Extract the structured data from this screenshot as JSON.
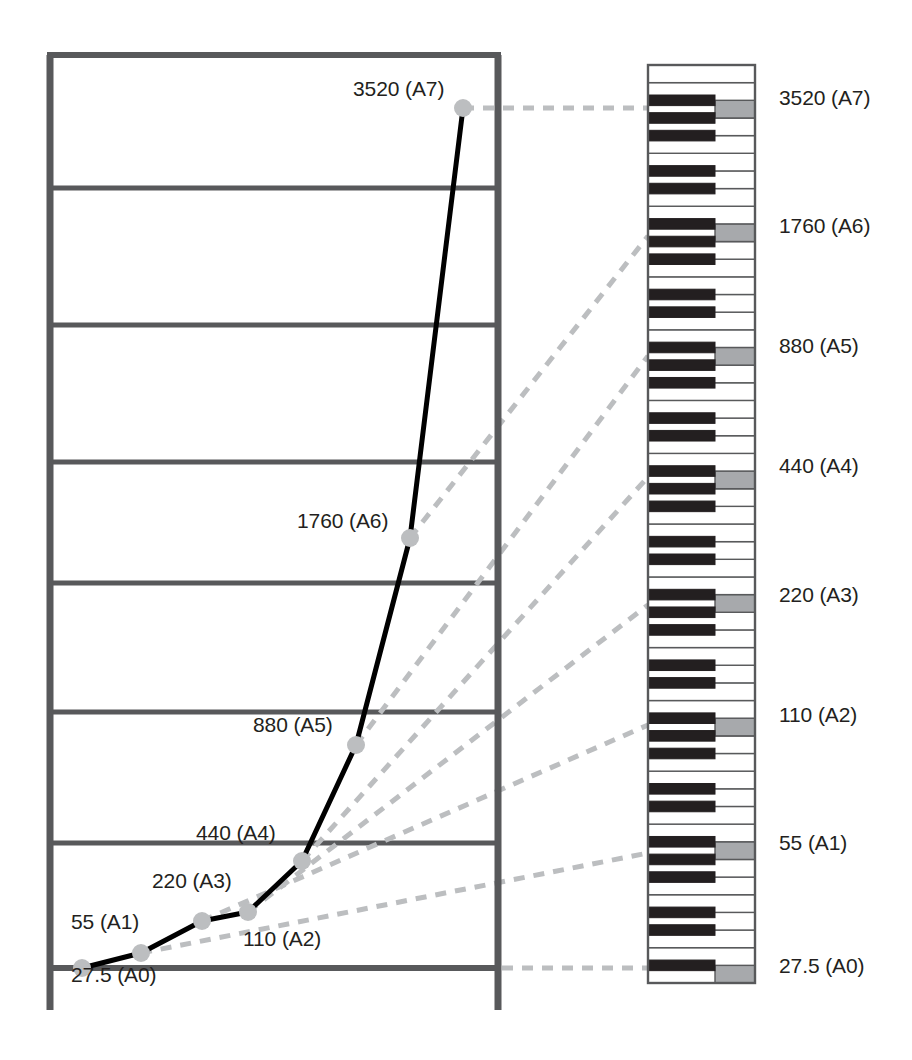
{
  "figure": {
    "title": ""
  },
  "colors": {
    "frame": "#58595b",
    "gridline": "#58595b",
    "curve": "#000000",
    "marker": "#bcbec0",
    "dashed_connector": "#bcbec0",
    "key_white": "#ffffff",
    "key_black": "#231f20",
    "key_highlight": "#a7a9ac",
    "key_outline": "#58595b",
    "text": "#231f20"
  },
  "chart_data": {
    "type": "line",
    "title": "",
    "xlabel": "",
    "ylabel": "",
    "grid": true,
    "gridlines_y": [
      27.5,
      440,
      880,
      1320,
      1760,
      2640,
      3520,
      4400
    ],
    "legend": "none",
    "categories": [
      "A0",
      "A1",
      "A2",
      "A3",
      "A4",
      "A5",
      "A6",
      "A7"
    ],
    "series": [
      {
        "name": "Frequency (Hz)",
        "values": [
          27.5,
          55,
          110,
          220,
          440,
          880,
          1760,
          3520
        ]
      }
    ],
    "point_labels": [
      "27.5 (A0)",
      "55 (A1)",
      "110 (A2)",
      "220 (A3)",
      "440 (A4)",
      "880 (A5)",
      "1760 (A6)",
      "3520 (A7)"
    ],
    "points": [
      {
        "label": "27.5 (A0)",
        "freq": 27.5,
        "note": "A0",
        "x": 82,
        "y": 968,
        "lx": 71,
        "ly": 978,
        "anchor": "left"
      },
      {
        "label": "55 (A1)",
        "freq": 55,
        "note": "A1",
        "x": 141,
        "y": 953,
        "lx": 71,
        "ly": 925,
        "anchor": "left"
      },
      {
        "label": "110 (A2)",
        "freq": 110,
        "note": "A2",
        "x": 202,
        "y": 921,
        "lx": 243,
        "ly": 942,
        "anchor": "left"
      },
      {
        "label": "220 (A3)",
        "freq": 220,
        "note": "A3",
        "x": 248,
        "y": 912,
        "lx": 152,
        "ly": 884,
        "anchor": "left"
      },
      {
        "label": "440 (A4)",
        "freq": 440,
        "note": "A4",
        "x": 302,
        "y": 861,
        "lx": 196,
        "ly": 836,
        "anchor": "left"
      },
      {
        "label": "880 (A5)",
        "freq": 880,
        "note": "A5",
        "x": 356,
        "y": 745,
        "lx": 253,
        "ly": 728,
        "anchor": "left"
      },
      {
        "label": "1760 (A6)",
        "freq": 1760,
        "note": "A6",
        "x": 410,
        "y": 538,
        "lx": 297,
        "ly": 524,
        "anchor": "left"
      },
      {
        "label": "3520 (A7)",
        "freq": 3520,
        "note": "A7",
        "x": 463,
        "y": 108,
        "lx": 353,
        "ly": 92,
        "anchor": "left"
      }
    ]
  },
  "keyboard": {
    "name": "piano-keyboard",
    "orientation": "vertical",
    "octave_count": 7,
    "highlighted_note": "A",
    "labels": [
      {
        "text": "3520 (A7)",
        "y": 100,
        "note": "A7"
      },
      {
        "text": "1760 (A6)",
        "y": 228,
        "note": "A6"
      },
      {
        "text": "880 (A5)",
        "y": 348,
        "note": "A5"
      },
      {
        "text": "440 (A4)",
        "y": 468,
        "note": "A4"
      },
      {
        "text": "220 (A3)",
        "y": 597,
        "note": "A3"
      },
      {
        "text": "110 (A2)",
        "y": 717,
        "note": "A2"
      },
      {
        "text": "55 (A1)",
        "y": 845,
        "note": "A1"
      },
      {
        "text": "27.5 (A0)",
        "y": 968,
        "note": "A0"
      }
    ]
  },
  "connectors": [
    {
      "from_note": "A7",
      "from_x": 463,
      "from_y": 108,
      "to_x": 648,
      "to_y": 108
    },
    {
      "from_note": "A6",
      "from_x": 410,
      "from_y": 538,
      "to_x": 648,
      "to_y": 236
    },
    {
      "from_note": "A5",
      "from_x": 356,
      "from_y": 745,
      "to_x": 648,
      "to_y": 356
    },
    {
      "from_note": "A4",
      "from_x": 302,
      "from_y": 861,
      "to_x": 648,
      "to_y": 477
    },
    {
      "from_note": "A3",
      "from_x": 248,
      "from_y": 912,
      "to_x": 648,
      "to_y": 605
    },
    {
      "from_note": "A2",
      "from_x": 202,
      "from_y": 921,
      "to_x": 648,
      "to_y": 725
    },
    {
      "from_note": "A1",
      "from_x": 141,
      "from_y": 953,
      "to_x": 648,
      "to_y": 853
    },
    {
      "from_note": "A0",
      "from_x": 82,
      "from_y": 968,
      "to_x": 648,
      "to_y": 968
    }
  ]
}
